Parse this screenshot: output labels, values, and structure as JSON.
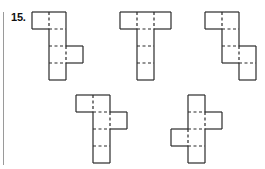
{
  "problem": {
    "number_label": "15."
  },
  "colors": {
    "line": "#2a2a2a",
    "divider": "#9a9a9a",
    "background": "#ffffff"
  },
  "cell_size": 17,
  "nets": [
    {
      "id": "net-1",
      "description": "column of 4 with square top-left and square right of 3rd cell",
      "cells": [
        [
          32,
          12
        ],
        [
          49,
          12
        ],
        [
          49,
          29
        ],
        [
          49,
          46
        ],
        [
          49,
          63
        ],
        [
          66,
          46
        ]
      ]
    },
    {
      "id": "net-2",
      "description": "T shape: row of 3 on top, column of 3 below middle",
      "cells": [
        [
          120,
          12
        ],
        [
          137,
          12
        ],
        [
          154,
          12
        ],
        [
          137,
          29
        ],
        [
          137,
          46
        ],
        [
          137,
          63
        ]
      ]
    },
    {
      "id": "net-3",
      "description": "staircase: square top-left, column of 3, column of 2 lower right",
      "cells": [
        [
          205,
          12
        ],
        [
          222,
          12
        ],
        [
          222,
          29
        ],
        [
          222,
          46
        ],
        [
          239,
          46
        ],
        [
          239,
          63
        ]
      ]
    },
    {
      "id": "net-4",
      "description": "column of 4 with square top-left and square right of 2nd cell",
      "cells": [
        [
          76,
          95
        ],
        [
          93,
          95
        ],
        [
          93,
          112
        ],
        [
          93,
          129
        ],
        [
          93,
          146
        ],
        [
          110,
          112
        ]
      ]
    },
    {
      "id": "net-5",
      "description": "column of 4 with square right of 2nd cell and square left of 3rd cell",
      "cells": [
        [
          188,
          95
        ],
        [
          188,
          112
        ],
        [
          188,
          129
        ],
        [
          188,
          146
        ],
        [
          205,
          112
        ],
        [
          171,
          129
        ]
      ]
    }
  ]
}
